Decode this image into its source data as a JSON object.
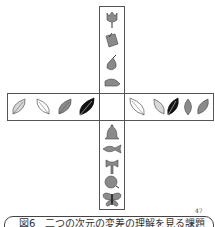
{
  "figure": {
    "caption": "図6　二つの次元の変差の理解を見る課題",
    "superscript": "47",
    "vertical_top_items": [
      {
        "name": "tulip",
        "shade": "#8a8a8a"
      },
      {
        "name": "book",
        "shade": "#8a8a8a"
      },
      {
        "name": "pear",
        "shade": "#8a8a8a"
      },
      {
        "name": "cap",
        "shade": "#8a8a8a"
      }
    ],
    "vertical_bottom_items": [
      {
        "name": "bell",
        "shade": "#8a8a8a"
      },
      {
        "name": "fish",
        "shade": "#8a8a8a"
      },
      {
        "name": "axe",
        "shade": "#8a8a8a"
      },
      {
        "name": "apple",
        "shade": "#8a8a8a"
      },
      {
        "name": "butterfly",
        "shade": "#8a8a8a"
      }
    ],
    "horizontal_left_leaves": [
      {
        "shade": "#d8d8d8"
      },
      {
        "shade": "#ffffff"
      },
      {
        "shade": "#8a8a8a"
      },
      {
        "shade": "#111111"
      }
    ],
    "horizontal_right_leaves": [
      {
        "shade": "#ffffff"
      },
      {
        "shade": "#d8d8d8"
      },
      {
        "shade": "#111111"
      },
      {
        "shade": "#8a8a8a"
      },
      {
        "shade": "#8a8a8a"
      }
    ]
  }
}
